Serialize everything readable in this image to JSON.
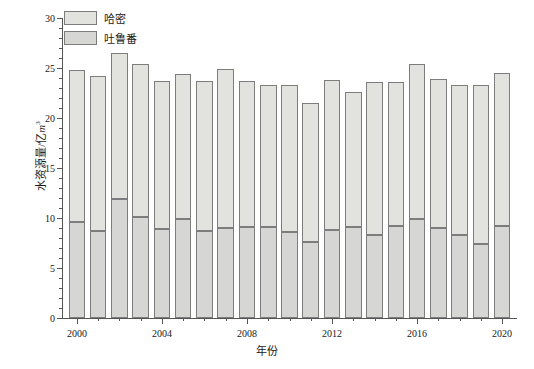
{
  "chart_data": {
    "type": "bar",
    "subtype": "stacked-bar",
    "title": "",
    "xlabel": "年份",
    "ylabel": "水资源量/亿m³",
    "ylabel_unit": "亿m³",
    "categories": [
      2000,
      2001,
      2002,
      2003,
      2004,
      2005,
      2006,
      2007,
      2008,
      2009,
      2010,
      2011,
      2012,
      2013,
      2014,
      2015,
      2016,
      2017,
      2018,
      2019,
      2020
    ],
    "series": [
      {
        "name": "吐鲁番",
        "stack_position": "bottom",
        "color": "#d6d6d4",
        "values": [
          9.6,
          8.7,
          11.9,
          10.1,
          8.9,
          9.9,
          8.7,
          9.0,
          9.1,
          9.1,
          8.6,
          7.6,
          8.8,
          9.1,
          8.3,
          9.2,
          9.9,
          9.0,
          8.3,
          7.4,
          9.2
        ]
      },
      {
        "name": "哈密",
        "stack_position": "top",
        "color": "#e2e2df",
        "values": [
          15.2,
          15.5,
          14.6,
          15.3,
          14.8,
          14.5,
          15.0,
          15.9,
          14.6,
          14.2,
          14.7,
          13.9,
          15.0,
          13.5,
          15.3,
          14.4,
          15.5,
          14.9,
          15.0,
          15.9,
          15.3
        ]
      }
    ],
    "totals": [
      24.8,
      24.2,
      26.5,
      25.4,
      23.7,
      24.4,
      23.7,
      24.9,
      23.7,
      23.3,
      23.3,
      21.5,
      23.8,
      22.6,
      23.6,
      23.6,
      25.4,
      23.9,
      23.3,
      23.3,
      24.5
    ],
    "xlim": [
      1999.3,
      2020.7
    ],
    "ylim": [
      0,
      30
    ],
    "ytick_major": [
      0,
      5,
      10,
      15,
      20,
      25,
      30
    ],
    "ytick_minor_step": 1,
    "xtick_major": [
      2000,
      2004,
      2008,
      2012,
      2016,
      2020
    ],
    "xtick_minor_step": 1,
    "grid": false,
    "legend_position": "top-left",
    "legend_entries": [
      "哈密",
      "吐鲁番"
    ]
  },
  "legend": {
    "items": [
      {
        "label": "哈密",
        "color": "#e2e2df"
      },
      {
        "label": "吐鲁番",
        "color": "#d6d6d4"
      }
    ]
  },
  "axes": {
    "y_title_main": "水资源量/",
    "y_title_unit_prefix": "亿",
    "y_title_unit_base": "m",
    "y_title_unit_sup": "3",
    "x_title": "年份",
    "y_tick_labels": [
      "30",
      "25",
      "20",
      "15",
      "10",
      "5",
      "0"
    ],
    "x_tick_labels": [
      "2000",
      "2004",
      "2008",
      "2012",
      "2016",
      "2020"
    ]
  }
}
